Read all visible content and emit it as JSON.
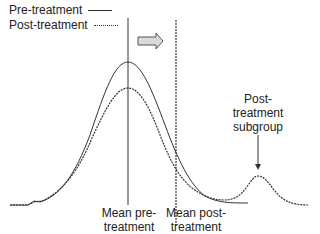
{
  "legend": {
    "items": [
      {
        "label": "Pre-treatment",
        "style": "solid"
      },
      {
        "label": "Post-treatment",
        "style": "dashed"
      }
    ]
  },
  "annotations": {
    "mean_pre_line1": "Mean pre-",
    "mean_pre_line2": "treatment",
    "mean_post_line1": "Mean post-",
    "mean_post_line2": "treatment",
    "subgroup_line1": "Post-",
    "subgroup_line2": "treatment",
    "subgroup_line3": "subgroup"
  },
  "icons": {
    "shift_arrow": "right-arrow-icon",
    "subgroup_pointer": "down-arrow-icon"
  },
  "colors": {
    "line": "#333333",
    "arrow_fill": "#d9d9d9",
    "background": "#ffffff"
  }
}
